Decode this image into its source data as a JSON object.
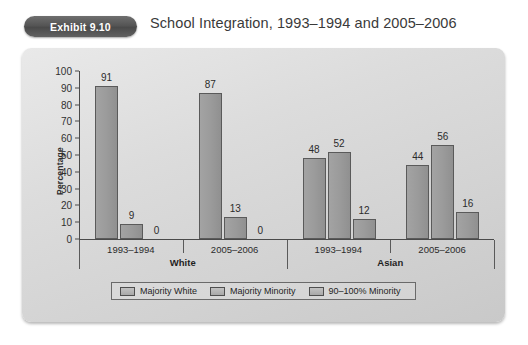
{
  "header": {
    "exhibit_badge": "Exhibit 9.10",
    "title": "School Integration, 1993–1994 and 2005–2006"
  },
  "chart_data": {
    "type": "bar",
    "title": "School Integration, 1993–1994 and 2005–2006",
    "xlabel": "",
    "ylabel": "Percentage",
    "ylim": [
      0,
      100
    ],
    "ytick_step": 10,
    "yticks": [
      "100",
      "90",
      "80",
      "70",
      "60",
      "50",
      "40",
      "30",
      "20",
      "10",
      "0"
    ],
    "grid": false,
    "legend_position": "bottom",
    "groups": [
      "White",
      "Asian"
    ],
    "categories": [
      "1993–1994",
      "2005–2006",
      "1993–1994",
      "2005–2006"
    ],
    "category_groups": [
      "White",
      "White",
      "Asian",
      "Asian"
    ],
    "series": [
      {
        "name": "Majority White",
        "values": [
          91,
          87,
          48,
          44
        ]
      },
      {
        "name": "Majority Minority",
        "values": [
          9,
          13,
          52,
          56
        ]
      },
      {
        "name": "90–100% Minority",
        "values": [
          0,
          0,
          12,
          16
        ]
      }
    ],
    "bar_color": "#9b9b9b",
    "bar_edge_color": "#5a5a5a",
    "axis_color": "#4a4a4a",
    "plot_background": "#dcdcdc"
  },
  "legend": {
    "items": [
      {
        "label": "Majority White"
      },
      {
        "label": "Majority Minority"
      },
      {
        "label": "90–100% Minority"
      }
    ]
  }
}
